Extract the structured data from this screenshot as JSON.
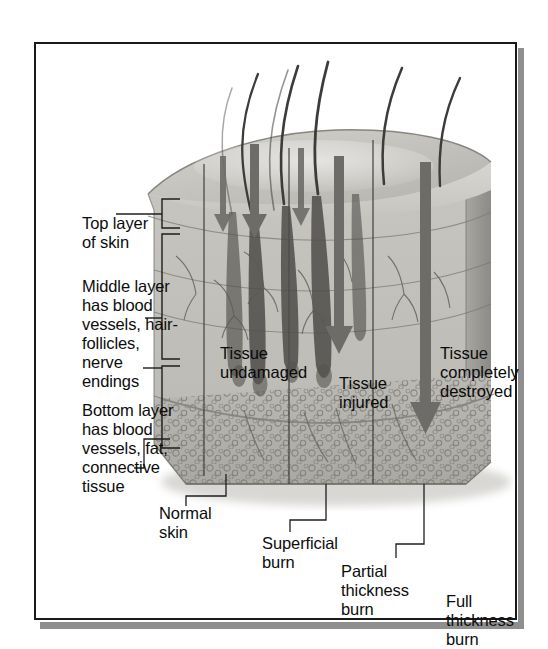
{
  "figure": {
    "type": "medical-illustration",
    "border_color": "#1a1a1a",
    "shadow_color": "#8f8f8f"
  },
  "layer_labels": [
    {
      "id": "top-layer",
      "text": "Top layer\nof skin"
    },
    {
      "id": "middle-layer",
      "text": "Middle layer\nhas blood\nvessels, hair-\nfollicles,\nnerve\nendings"
    },
    {
      "id": "bottom-layer",
      "text": "Bottom layer\nhas blood\nvessels, fat,\nconnective\ntissue"
    }
  ],
  "zone_labels": [
    {
      "id": "tissue-undamaged",
      "text": "Tissue\nundamaged"
    },
    {
      "id": "tissue-injured",
      "text": "Tissue\ninjured"
    },
    {
      "id": "tissue-completely-destroyed",
      "text": "Tissue\ncompletely\ndestroyed"
    }
  ],
  "burn_labels": [
    {
      "id": "normal-skin",
      "text": "Normal\nskin"
    },
    {
      "id": "superficial-burn",
      "text": "Superficial\nburn"
    },
    {
      "id": "partial-thickness-burn",
      "text": "Partial\nthickness\nburn"
    },
    {
      "id": "full-thickness-burn",
      "text": "Full\nthickness\nburn"
    }
  ],
  "arrows": [
    {
      "id": "arrow-superficial",
      "depth": "shallow"
    },
    {
      "id": "arrow-partial-thickness",
      "depth": "medium"
    },
    {
      "id": "arrow-full-thickness",
      "depth": "deep"
    }
  ],
  "colors": {
    "epidermis": "#cfcdc8",
    "dermis": "#c4c2bc",
    "hypodermis": "#b9b7b1",
    "side_face": "#a6a49e",
    "hair": "#4a4845",
    "arrow": "#6e6c68",
    "leader": "#2b2b2b"
  }
}
